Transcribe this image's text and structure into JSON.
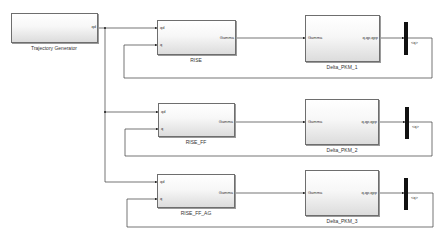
{
  "diagram": {
    "type": "simulink-block-diagram",
    "wire_color": "#3a3a3a",
    "blocks": {
      "trajectory_generator": {
        "label": "Trajectory Generator",
        "out_port": "qd"
      },
      "controllers": [
        {
          "label": "RISE",
          "in_ports": [
            "qd",
            "q"
          ],
          "out_port": "Gamma"
        },
        {
          "label": "RISE_FF",
          "in_ports": [
            "qd",
            "q"
          ],
          "out_port": "Gamma"
        },
        {
          "label": "RISE_FF_AG",
          "in_ports": [
            "qd",
            "q"
          ],
          "out_port": "Gamma"
        }
      ],
      "plants": [
        {
          "label": "Delta_PKM_1",
          "in_port": "Gamma",
          "out_port": "q,qp,qpp"
        },
        {
          "label": "Delta_PKM_2",
          "in_port": "Gamma",
          "out_port": "q,qp,qpp"
        },
        {
          "label": "Delta_PKM_3",
          "in_port": "Gamma",
          "out_port": "q,qp,qpp"
        }
      ],
      "demuxes": [
        {
          "out_label": "<q>"
        },
        {
          "out_label": "<q>"
        },
        {
          "out_label": "<q>"
        }
      ]
    }
  }
}
